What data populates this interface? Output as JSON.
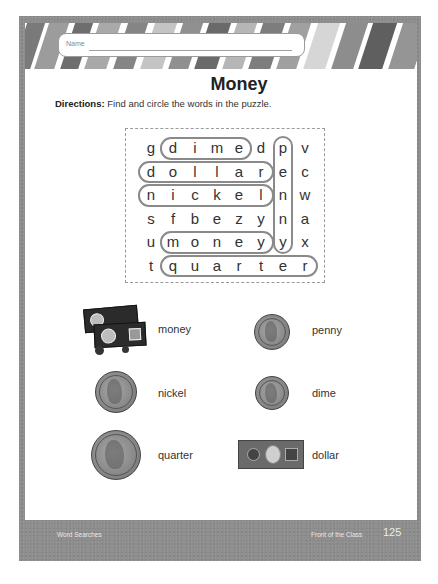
{
  "worksheet": {
    "name_label": "Name",
    "title": "Money",
    "directions_label": "Directions:",
    "directions_text": " Find and circle the words in the puzzle."
  },
  "puzzle": {
    "rows": [
      [
        "g",
        "d",
        "i",
        "m",
        "e",
        "d",
        "p",
        "v"
      ],
      [
        "d",
        "o",
        "l",
        "l",
        "a",
        "r",
        "e",
        "c"
      ],
      [
        "n",
        "i",
        "c",
        "k",
        "e",
        "l",
        "n",
        "w"
      ],
      [
        "s",
        "f",
        "b",
        "e",
        "z",
        "y",
        "n",
        "a"
      ],
      [
        "u",
        "m",
        "o",
        "n",
        "e",
        "y",
        "y",
        "x"
      ],
      [
        "t",
        "q",
        "u",
        "a",
        "r",
        "t",
        "e",
        "r"
      ]
    ],
    "found_words": [
      {
        "word": "dime",
        "direction": "horizontal",
        "row": 0,
        "col_start": 1,
        "col_end": 4
      },
      {
        "word": "dollar",
        "direction": "horizontal",
        "row": 1,
        "col_start": 0,
        "col_end": 5
      },
      {
        "word": "nickel",
        "direction": "horizontal",
        "row": 2,
        "col_start": 0,
        "col_end": 5
      },
      {
        "word": "money",
        "direction": "horizontal",
        "row": 4,
        "col_start": 1,
        "col_end": 5
      },
      {
        "word": "quarter",
        "direction": "horizontal",
        "row": 5,
        "col_start": 1,
        "col_end": 7
      },
      {
        "word": "penny",
        "direction": "vertical",
        "col": 6,
        "row_start": 0,
        "row_end": 4
      }
    ]
  },
  "items": [
    {
      "label": "money",
      "icon": "money-stack-icon"
    },
    {
      "label": "penny",
      "icon": "penny-coin-icon"
    },
    {
      "label": "nickel",
      "icon": "nickel-coin-icon"
    },
    {
      "label": "dime",
      "icon": "dime-coin-icon"
    },
    {
      "label": "quarter",
      "icon": "quarter-coin-icon"
    },
    {
      "label": "dollar",
      "icon": "dollar-bill-icon"
    }
  ],
  "footer": {
    "section": "Word Searches",
    "publisher": "Front of the Class",
    "page_number": "125"
  },
  "colors": {
    "frame": "#8e8e8e",
    "highlight_border": "#8a8a8a",
    "text": "#333333"
  }
}
